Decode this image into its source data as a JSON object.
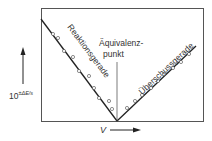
{
  "diagram": {
    "y_axis_label_base": "10",
    "y_axis_label_exponent": "±ΔE/s",
    "x_axis_label": "V",
    "line_left_label": "Reaktionsgerade",
    "line_right_label": "Überschussgerade",
    "equivalence_label_line1": "Äquivalenz-",
    "equivalence_label_line2": "punkt"
  }
}
